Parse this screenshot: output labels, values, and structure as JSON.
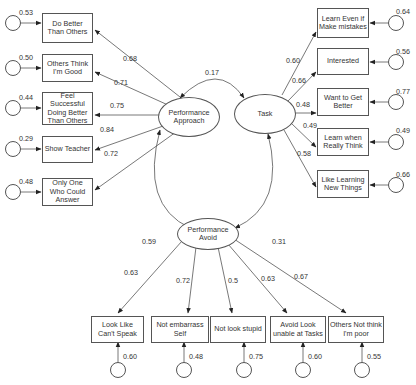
{
  "diagram": {
    "type": "structural-equation-model",
    "latent_factors": [
      {
        "id": "pap",
        "label": "Performance Approach"
      },
      {
        "id": "task",
        "label": "Task"
      },
      {
        "id": "pav",
        "label": "Performance Avoid"
      }
    ],
    "factor_correlations": [
      {
        "from": "pap",
        "to": "task",
        "value": "0.17"
      },
      {
        "from": "pap",
        "to": "pav",
        "value": "0.59"
      },
      {
        "from": "task",
        "to": "pav",
        "value": "0.31"
      }
    ],
    "indicators": {
      "pap": [
        {
          "label": "Do Better Than Others",
          "loading": "0.68",
          "error": "0.53"
        },
        {
          "label": "Others Think I'm Good",
          "loading": "0.71",
          "error": "0.50"
        },
        {
          "label": "Feel Successful Doing Better Than Others",
          "loading": "0.75",
          "error": "0.44"
        },
        {
          "label": "Show Teacher",
          "loading": "0.84",
          "error": "0.29"
        },
        {
          "label": "Only One Who Could Answer",
          "loading": "0.72",
          "error": "0.48"
        }
      ],
      "task": [
        {
          "label": "Learn Even if Make mistakes",
          "loading": "0.60",
          "error": "0.64"
        },
        {
          "label": "Interested",
          "loading": "0.66",
          "error": "0.56"
        },
        {
          "label": "Want to Get Better",
          "loading": "0.48",
          "error": "0.77"
        },
        {
          "label": "Learn when Really Think",
          "loading": "0.49",
          "error": "0.49"
        },
        {
          "label": "Like Learning New Things",
          "loading": "0.58",
          "error": "0.66"
        }
      ],
      "pav": [
        {
          "label": "Look Like Can't Speak",
          "loading": "0.63",
          "error": "0.60"
        },
        {
          "label": "Not embarrass Self",
          "loading": "0.72",
          "error": "0.48"
        },
        {
          "label": "Not look stupid",
          "loading": "0.5",
          "error": "0.75"
        },
        {
          "label": "Avoid Look unable at Tasks",
          "loading": "0.63",
          "error": "0.60"
        },
        {
          "label": "Others Not think I'm poor",
          "loading": "0.67",
          "error": "0.55"
        }
      ]
    }
  }
}
